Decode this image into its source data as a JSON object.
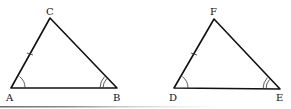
{
  "diagram": {
    "type": "congruent-triangles",
    "triangles": [
      {
        "name": "ABC",
        "vertices": {
          "A": {
            "label": "A",
            "x": 11,
            "y": 88
          },
          "B": {
            "label": "B",
            "x": 117,
            "y": 88
          },
          "C": {
            "label": "C",
            "x": 50,
            "y": 18
          }
        },
        "marked_side": "AC",
        "side_marks": 1,
        "angle_marks": {
          "A": 1,
          "B": 2
        }
      },
      {
        "name": "DEF",
        "vertices": {
          "D": {
            "label": "D",
            "x": 174,
            "y": 88
          },
          "E": {
            "label": "E",
            "x": 280,
            "y": 89
          },
          "F": {
            "label": "F",
            "x": 214,
            "y": 19
          }
        },
        "marked_side": "DF",
        "side_marks": 1,
        "angle_marks": {
          "D": 1,
          "E": 2
        }
      }
    ],
    "labels": {
      "A": "A",
      "B": "B",
      "C": "C",
      "D": "D",
      "E": "E",
      "F": "F"
    },
    "colors": {
      "line": "#111111",
      "background": "#ffffff",
      "bottom_bar": "#9a9a9a"
    }
  }
}
